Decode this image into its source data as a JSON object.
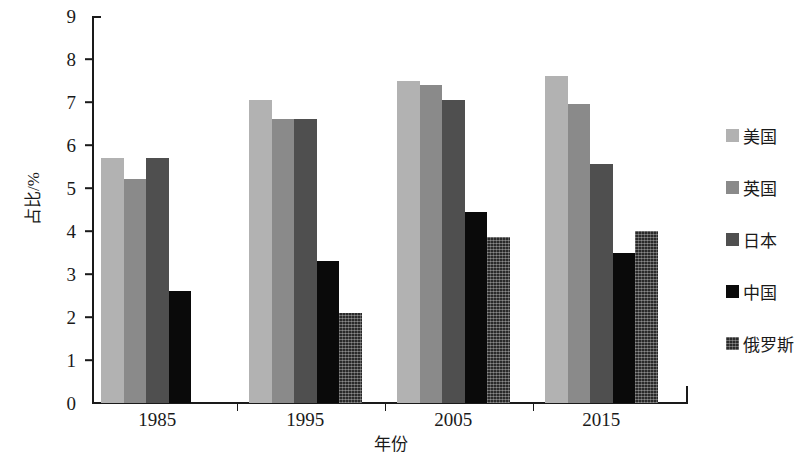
{
  "chart_data": {
    "type": "bar",
    "title": "",
    "xlabel": "年份",
    "ylabel": "占比/%",
    "categories": [
      "1985",
      "1995",
      "2005",
      "2015"
    ],
    "ylim": [
      0,
      9
    ],
    "ytick_labels": [
      "0",
      "1",
      "2",
      "3",
      "4",
      "5",
      "6",
      "7",
      "8",
      "9"
    ],
    "grid": false,
    "legend_position": "right",
    "series": [
      {
        "name": "美国",
        "color": "#b2b2b2",
        "values": [
          5.7,
          7.05,
          7.5,
          7.6
        ]
      },
      {
        "name": "英国",
        "color": "#8a8a8a",
        "values": [
          5.2,
          6.6,
          7.4,
          6.95
        ]
      },
      {
        "name": "日本",
        "color": "#4f4f4f",
        "values": [
          5.7,
          6.6,
          7.05,
          5.55
        ]
      },
      {
        "name": "中国",
        "color": "#0a0a0a",
        "values": [
          2.6,
          3.3,
          4.45,
          3.5
        ]
      },
      {
        "name": "俄罗斯",
        "color": "#2a2a2a",
        "values": [
          null,
          2.1,
          3.85,
          4.0
        ]
      }
    ]
  }
}
